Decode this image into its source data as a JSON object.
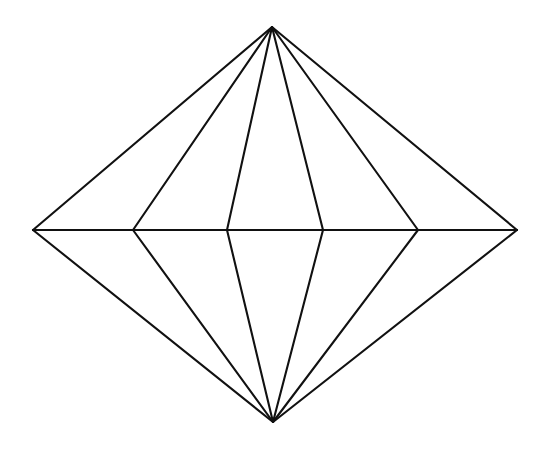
{
  "figure": {
    "background_color": "#ffffff",
    "stroke_color": "#111111",
    "stroke_width": 2.1,
    "canvas": {
      "width": 547,
      "height": 451
    }
  },
  "chart_data": {
    "type": "diagram",
    "grid": false,
    "legend": null,
    "xlim": [
      0,
      547
    ],
    "ylim": [
      0,
      451
    ],
    "vertices": [
      {
        "id": "apex-top",
        "label": "top apex",
        "x": 272,
        "y": 27
      },
      {
        "id": "apex-bottom",
        "label": "bottom apex",
        "x": 273,
        "y": 422
      },
      {
        "id": "eq-left",
        "label": "left equator vertex",
        "x": 33,
        "y": 230
      },
      {
        "id": "eq-left-in",
        "label": "left inner vertex",
        "x": 133,
        "y": 230
      },
      {
        "id": "eq-mid-left",
        "label": "center-left vertex",
        "x": 227,
        "y": 230
      },
      {
        "id": "eq-mid-right",
        "label": "center-right vertex",
        "x": 323,
        "y": 230
      },
      {
        "id": "eq-right-in",
        "label": "right inner vertex",
        "x": 418,
        "y": 230
      },
      {
        "id": "eq-right",
        "label": "right equator vertex",
        "x": 517,
        "y": 230
      }
    ],
    "edges": [
      {
        "id": "equator",
        "from": "eq-left",
        "to": "eq-right",
        "kind": "equator"
      },
      {
        "id": "top-left",
        "from": "apex-top",
        "to": "eq-left",
        "kind": "upper"
      },
      {
        "id": "top-left-in",
        "from": "apex-top",
        "to": "eq-left-in",
        "kind": "upper"
      },
      {
        "id": "top-mid-left",
        "from": "apex-top",
        "to": "eq-mid-left",
        "kind": "upper"
      },
      {
        "id": "top-mid-right",
        "from": "apex-top",
        "to": "eq-mid-right",
        "kind": "upper"
      },
      {
        "id": "top-right-in",
        "from": "apex-top",
        "to": "eq-right-in",
        "kind": "upper"
      },
      {
        "id": "top-right",
        "from": "apex-top",
        "to": "eq-right",
        "kind": "upper"
      },
      {
        "id": "bottom-left",
        "from": "apex-bottom",
        "to": "eq-left",
        "kind": "lower"
      },
      {
        "id": "bottom-left-in",
        "from": "apex-bottom",
        "to": "eq-left-in",
        "kind": "lower"
      },
      {
        "id": "bottom-mid-left",
        "from": "apex-bottom",
        "to": "eq-mid-left",
        "kind": "lower"
      },
      {
        "id": "bottom-mid-right",
        "from": "apex-bottom",
        "to": "eq-mid-right",
        "kind": "lower"
      },
      {
        "id": "bottom-right-in",
        "from": "apex-bottom",
        "to": "eq-right-in",
        "kind": "lower"
      },
      {
        "id": "bottom-right",
        "from": "apex-bottom",
        "to": "eq-right",
        "kind": "lower"
      }
    ]
  }
}
